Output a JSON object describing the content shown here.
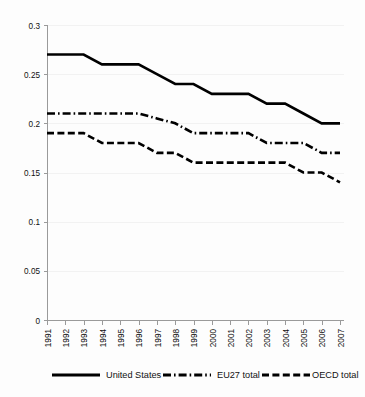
{
  "chart_data": {
    "type": "line",
    "title": "",
    "subtitle": "",
    "xlabel": "",
    "ylabel": "",
    "categories": [
      "1991",
      "1992",
      "1993",
      "1994",
      "1995",
      "1996",
      "1997",
      "1998",
      "1999",
      "2000",
      "2001",
      "2002",
      "2003",
      "2004",
      "2005",
      "2006",
      "2007"
    ],
    "x_tick_labels": [
      "1991",
      "1992",
      "1993",
      "1994",
      "1995",
      "1996",
      "1997",
      "1998",
      "1999",
      "2000",
      "2001",
      "2002",
      "2003",
      "2004",
      "2005",
      "2006",
      "2007"
    ],
    "y_tick_labels": [
      "0.3",
      "0.25",
      "0.2",
      "0.15",
      "0.1",
      "0.05",
      "0"
    ],
    "y_tick_values": [
      0.3,
      0.25,
      0.2,
      0.15,
      0.1,
      0.05,
      0
    ],
    "ylim": [
      0,
      0.3
    ],
    "grid": true,
    "legend_position": "bottom",
    "series": [
      {
        "name": "United States",
        "style": "solid",
        "color": "#000000",
        "values": [
          0.27,
          0.27,
          0.27,
          0.26,
          0.26,
          0.26,
          0.25,
          0.24,
          0.24,
          0.23,
          0.23,
          0.23,
          0.22,
          0.22,
          0.21,
          0.2,
          0.2
        ]
      },
      {
        "name": "EU27 total",
        "style": "dash-dot",
        "color": "#000000",
        "values": [
          0.21,
          0.21,
          0.21,
          0.21,
          0.21,
          0.21,
          0.205,
          0.2,
          0.19,
          0.19,
          0.19,
          0.19,
          0.18,
          0.18,
          0.18,
          0.17,
          0.17
        ]
      },
      {
        "name": "OECD total",
        "style": "dashed",
        "color": "#000000",
        "values": [
          0.19,
          0.19,
          0.19,
          0.18,
          0.18,
          0.18,
          0.17,
          0.17,
          0.16,
          0.16,
          0.16,
          0.16,
          0.16,
          0.16,
          0.15,
          0.15,
          0.14
        ]
      }
    ],
    "legend": [
      {
        "label": "United States",
        "style": "solid"
      },
      {
        "label": "EU27 total",
        "style": "dash-dot"
      },
      {
        "label": "OECD total",
        "style": "dashed"
      }
    ]
  }
}
